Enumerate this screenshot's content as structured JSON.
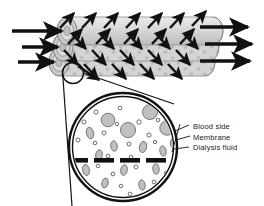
{
  "figure": {
    "background_color": "#ffffff"
  },
  "labels": {
    "blood_side": "Blood side",
    "membrane": "Membrane",
    "dialysis_fluid": "Dialysis fluid"
  },
  "colors": {
    "tube_fill": "#d2d2d2",
    "tube_fill_light": "#e4e4e4",
    "tube_stroke": "#8a8a8a",
    "arrow": "#111111",
    "outline": "#111111",
    "cell_fill": "#c0c0c0",
    "cell_stroke": "#6e6e6e",
    "pore_fill": "#ffffff",
    "membrane_bar": "#111111",
    "label_text": "#1a1a2e"
  },
  "tubes": [
    {
      "name": "fiber-tube-top",
      "inlet_arrow": true,
      "outlet_arrow": true
    },
    {
      "name": "fiber-tube-middle",
      "inlet_arrow": true,
      "outlet_arrow": true
    },
    {
      "name": "fiber-tube-bottom",
      "inlet_arrow": true,
      "outlet_arrow": true
    }
  ],
  "counts": {
    "tubes": 3,
    "inlet_arrows": 3,
    "outlet_arrows": 3,
    "membrane_segments": 5,
    "diffusion_arrows_up": 12,
    "diffusion_arrows_down": 13
  },
  "inset": {
    "name": "magnified-cross-section",
    "shape": "circle",
    "center_x": 123,
    "center_y": 147,
    "radius": 54,
    "blood_cells": 18,
    "solute_pores": 34
  }
}
